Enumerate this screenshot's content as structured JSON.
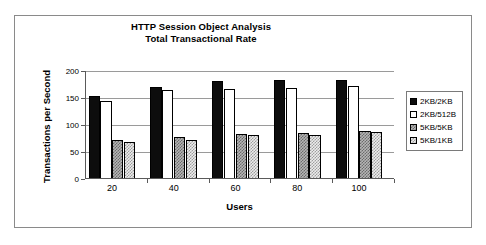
{
  "chart_data": {
    "type": "bar",
    "title": "HTTP Session Object Analysis",
    "subtitle": "Total Transactional Rate",
    "xlabel": "Users",
    "ylabel": "Transactions per Second",
    "categories": [
      "20",
      "40",
      "60",
      "80",
      "100"
    ],
    "series": [
      {
        "name": "2KB/2KB",
        "values": [
          153,
          171,
          181,
          183,
          183
        ]
      },
      {
        "name": "2KB/512B",
        "values": [
          145,
          164,
          166,
          169,
          172
        ]
      },
      {
        "name": "5KB/5KB",
        "values": [
          72,
          77,
          84,
          86,
          89
        ]
      },
      {
        "name": "5KB/1KB",
        "values": [
          69,
          73,
          81,
          82,
          87
        ]
      }
    ],
    "ylim": [
      0,
      200
    ],
    "yticks": [
      0,
      50,
      100,
      150,
      200
    ],
    "ytick_labels": [
      "0",
      "50",
      "100",
      "150",
      "200"
    ],
    "grid": true,
    "legend_position": "right"
  },
  "legend": {
    "items": [
      {
        "label": "2KB/2KB"
      },
      {
        "label": "2KB/512B"
      },
      {
        "label": "5KB/5KB"
      },
      {
        "label": "5KB/1KB"
      }
    ]
  }
}
